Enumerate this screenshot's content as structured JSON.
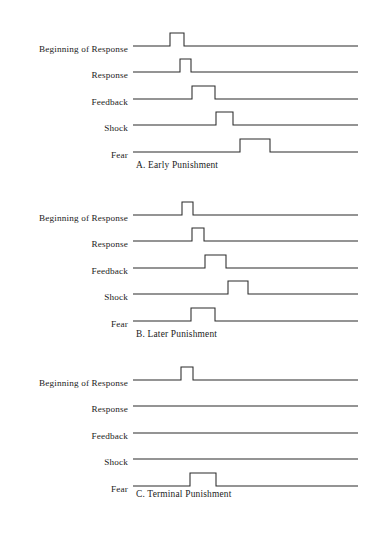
{
  "figure": {
    "type": "timing-diagram",
    "title": "",
    "background_color": "#ffffff",
    "line_color": "#2b2b2b",
    "text_color": "#1c1c1c",
    "channel_labels": [
      "Beginning of Response",
      "Response",
      "Feedback",
      "Shock",
      "Fear"
    ],
    "axis": {
      "baseline_start_x": 133,
      "baseline_end_x": 358,
      "pulse_height_px": 13
    }
  },
  "panels": [
    {
      "id": "A",
      "caption": "A. Early Punishment",
      "caption_x": 136,
      "caption_y": 160,
      "top": 24,
      "row_height": 26.4,
      "labels": [
        "Beginning of Response",
        "Response",
        "Feedback",
        "Shock",
        "Fear"
      ],
      "traces": [
        {
          "channel": "Beginning of Response",
          "pulses": [
            {
              "start": 170,
              "end": 184
            }
          ]
        },
        {
          "channel": "Response",
          "pulses": [
            {
              "start": 180,
              "end": 191
            }
          ]
        },
        {
          "channel": "Feedback",
          "pulses": [
            {
              "start": 192,
              "end": 215
            }
          ]
        },
        {
          "channel": "Shock",
          "pulses": [
            {
              "start": 216,
              "end": 233
            }
          ]
        },
        {
          "channel": "Fear",
          "pulses": [
            {
              "start": 240,
              "end": 270
            }
          ]
        }
      ]
    },
    {
      "id": "B",
      "caption": "B. Later Punishment",
      "caption_x": 136,
      "caption_y": 329,
      "top": 193,
      "row_height": 26.4,
      "labels": [
        "Beginning of Response",
        "Response",
        "Feedback",
        "Shock",
        "Fear"
      ],
      "traces": [
        {
          "channel": "Beginning of Response",
          "pulses": [
            {
              "start": 182,
              "end": 193
            }
          ]
        },
        {
          "channel": "Response",
          "pulses": [
            {
              "start": 192,
              "end": 204
            }
          ]
        },
        {
          "channel": "Feedback",
          "pulses": [
            {
              "start": 205,
              "end": 226
            }
          ]
        },
        {
          "channel": "Shock",
          "pulses": [
            {
              "start": 228,
              "end": 248
            }
          ]
        },
        {
          "channel": "Fear",
          "pulses": [
            {
              "start": 191,
              "end": 215
            }
          ]
        }
      ]
    },
    {
      "id": "C",
      "caption": "C. Terminal Punishment",
      "caption_x": 136,
      "caption_y": 489,
      "top": 358,
      "row_height": 26.4,
      "labels": [
        "Beginning of Response",
        "Response",
        "Feedback",
        "Shock",
        "Fear"
      ],
      "traces": [
        {
          "channel": "Beginning of Response",
          "pulses": [
            {
              "start": 181,
              "end": 193
            }
          ]
        },
        {
          "channel": "Response",
          "pulses": []
        },
        {
          "channel": "Feedback",
          "pulses": []
        },
        {
          "channel": "Shock",
          "pulses": []
        },
        {
          "channel": "Fear",
          "pulses": [
            {
              "start": 190,
              "end": 216
            }
          ]
        }
      ]
    }
  ]
}
